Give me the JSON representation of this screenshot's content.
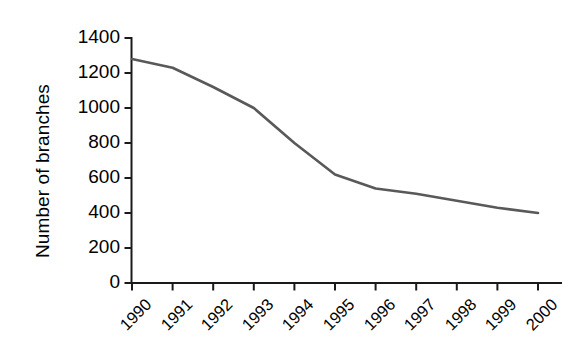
{
  "chart_data": {
    "type": "line",
    "title": "",
    "xlabel": "",
    "ylabel": "Number of branches",
    "categories": [
      "1990",
      "1991",
      "1992",
      "1993",
      "1994",
      "1995",
      "1996",
      "1997",
      "1998",
      "1999",
      "2000"
    ],
    "values": [
      1280,
      1230,
      1120,
      1000,
      800,
      620,
      540,
      510,
      470,
      430,
      400
    ],
    "series": [
      {
        "name": "Number of branches",
        "values": [
          1280,
          1230,
          1120,
          1000,
          800,
          620,
          540,
          510,
          470,
          430,
          400
        ]
      }
    ],
    "ylim": [
      0,
      1400
    ],
    "yticks": [
      0,
      200,
      400,
      600,
      800,
      1000,
      1200,
      1400
    ],
    "ytick_labels": [
      "0",
      "200",
      "400",
      "600",
      "800",
      "1000",
      "1200",
      "1400"
    ],
    "xtick_labels": [
      "1990",
      "1991",
      "1992",
      "1993",
      "1994",
      "1995",
      "1996",
      "1997",
      "1998",
      "1999",
      "2000"
    ],
    "xtick_rotation": -45,
    "grid": false,
    "legend": false,
    "legend_position": "none",
    "line_color": "#595959",
    "axis_color": "#1a1a1a",
    "background_color": "#ffffff"
  }
}
